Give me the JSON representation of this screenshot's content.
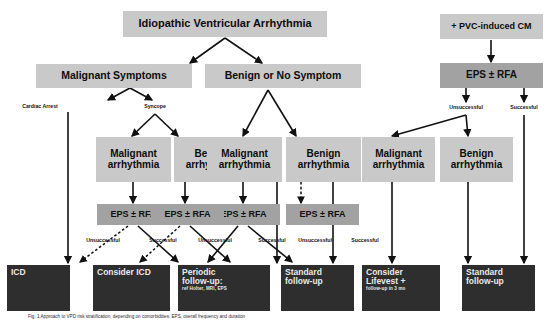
{
  "diagram": {
    "title_box": {
      "label": "Idiopathic Ventricular Arrhythmia"
    },
    "pvc_box": {
      "label": "+ PVC-induced CM"
    },
    "level2": [
      {
        "label": "Malignant Symptoms"
      },
      {
        "label": "Benign or No Symptom"
      }
    ],
    "branch_labels": [
      {
        "label": "Cardiac Arrest"
      },
      {
        "label": "Syncope"
      },
      {
        "label": "Unsuccessful"
      },
      {
        "label": "Successful"
      }
    ],
    "arrhythmia_boxes": [
      {
        "line1": "Malignant",
        "line2": "arrhythmia"
      },
      {
        "line1": "Benign",
        "line2": "arrhythmia"
      },
      {
        "line1": "Malignant",
        "line2": "arrhythmia"
      },
      {
        "line1": "Benign",
        "line2": "arrhythmia"
      },
      {
        "line1": "Malignant",
        "line2": "arrhythmia"
      },
      {
        "line1": "Benign",
        "line2": "arrhythmia"
      }
    ],
    "eps_boxes": [
      {
        "label": "EPS ± RFA"
      },
      {
        "label": "EPS ± RFA"
      },
      {
        "label": "EPS ± RFA"
      },
      {
        "label": "EPS ± RFA"
      },
      {
        "label": "EPS ± RFA"
      }
    ],
    "outcome_labels": [
      {
        "label": "Unsuccessful"
      },
      {
        "label": "Successful"
      },
      {
        "label": "Unsuccessful"
      },
      {
        "label": "Successful"
      },
      {
        "label": "Unsuccessful"
      },
      {
        "label": "Successful"
      }
    ],
    "result_boxes": [
      {
        "line1": "ICD",
        "line2": "",
        "sub": ""
      },
      {
        "line1": "Consider ICD",
        "line2": "",
        "sub": ""
      },
      {
        "line1": "Periodic",
        "line2": "follow-up:",
        "sub": "ref Holter, MRI, EPS"
      },
      {
        "line1": "Standard",
        "line2": "follow-up",
        "sub": ""
      },
      {
        "line1": "Consider",
        "line2": "Lifevest +",
        "sub": "follow-up in 3 mo"
      },
      {
        "line1": "Standard",
        "line2": "follow-up",
        "sub": ""
      }
    ],
    "caption": "Fig. 1  Approach to VPD risk stratification, depending on comorbidities. EPS, overall frequency and duration",
    "colors": {
      "light_box": "#c9c9c9",
      "mid_box": "#a2a2a2",
      "dark_box": "#2e2e2e",
      "line": "#111111",
      "background": "#ffffff"
    }
  }
}
